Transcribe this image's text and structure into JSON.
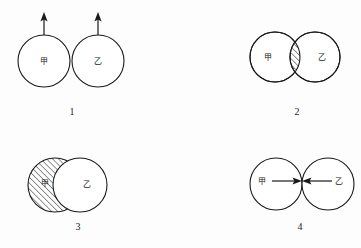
{
  "figure": {
    "background_color": "#fdfdfd",
    "stroke_color": "#1a1a1a",
    "hatch_color": "#1a1a1a",
    "fill_color": "#ffffff",
    "width": 361,
    "height": 248
  },
  "labels": {
    "jia": "甲",
    "yi": "乙"
  },
  "panels": [
    {
      "number": "1",
      "description": "Two tangent circles side by side, each with an upward arrow rising from its top",
      "jia_label": "甲",
      "yi_label": "乙",
      "number_x": 72,
      "number_y": 113,
      "jia": {
        "cx": 44,
        "cy": 61,
        "r": 26,
        "label_x": 44,
        "label_y": 61,
        "hatched": false
      },
      "yi": {
        "cx": 98,
        "cy": 61,
        "r": 26,
        "label_x": 98,
        "label_y": 61,
        "hatched": false
      },
      "arrows": [
        {
          "name": "arrow-up-jia",
          "x": 44,
          "y_start": 35,
          "y_end": 14,
          "direction": "up"
        },
        {
          "name": "arrow-up-yi",
          "x": 98,
          "y_start": 35,
          "y_end": 14,
          "direction": "up"
        }
      ]
    },
    {
      "number": "2",
      "description": "Two overlapping circles whose lens-shaped intersection is hatched",
      "jia_label": "甲",
      "yi_label": "乙",
      "number_x": 297,
      "number_y": 113,
      "jia": {
        "cx": 275,
        "cy": 57,
        "r": 25,
        "label_x": 268,
        "label_y": 57,
        "hatched": false
      },
      "yi": {
        "cx": 315,
        "cy": 57,
        "r": 25,
        "label_x": 322,
        "label_y": 57,
        "hatched": false
      },
      "overlap_hatched": true
    },
    {
      "number": "3",
      "description": "Hatched circle 甲 behind, white circle 乙 in front covering most of it, leaving a hatched crescent",
      "jia_label": "甲",
      "yi_label": "乙",
      "number_x": 78,
      "number_y": 228,
      "jia": {
        "cx": 55,
        "cy": 185,
        "r": 27,
        "label_x": 45,
        "label_y": 183,
        "hatched": true
      },
      "yi": {
        "cx": 80,
        "cy": 185,
        "r": 27,
        "label_x": 87,
        "label_y": 184,
        "hatched": false
      }
    },
    {
      "number": "4",
      "description": "Two tangent circles with arrows pointing inward toward the point of contact",
      "jia_label": "甲",
      "yi_label": "乙",
      "number_x": 300,
      "number_y": 228,
      "jia": {
        "cx": 276,
        "cy": 184,
        "r": 26,
        "label_x": 262,
        "label_y": 181,
        "hatched": false
      },
      "yi": {
        "cx": 328,
        "cy": 184,
        "r": 26,
        "label_x": 339,
        "label_y": 181,
        "hatched": false
      },
      "arrows": [
        {
          "name": "arrow-right-jia",
          "y": 181,
          "x_start": 274,
          "x_end": 300,
          "direction": "right"
        },
        {
          "name": "arrow-left-yi",
          "y": 181,
          "x_start": 330,
          "x_end": 304,
          "direction": "left"
        }
      ]
    }
  ]
}
